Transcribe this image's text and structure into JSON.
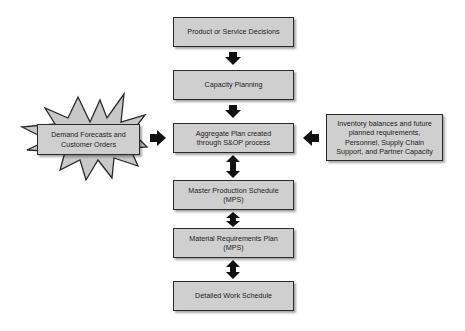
{
  "diagram": {
    "colors": {
      "box_fill": "#cfcfcf",
      "box_border": "#2a2a2a",
      "arrow": "#111111",
      "text": "#222222"
    },
    "main_flow": [
      {
        "id": "product",
        "label": "Product or Service Decisions"
      },
      {
        "id": "capacity",
        "label": "Capacity Planning"
      },
      {
        "id": "aggregate",
        "label": "Aggregate Plan created through S&OP process"
      },
      {
        "id": "mps",
        "label": "Master Production Schedule (MPS)"
      },
      {
        "id": "mrp",
        "label": "Material Requirements Plan (MPS)"
      },
      {
        "id": "detailed",
        "label": "Detailed Work Schedule"
      }
    ],
    "left_input": {
      "label": "Demand Forecasts and Customer Orders",
      "shape": "starburst"
    },
    "right_input": {
      "label": "Inventory balances and future planned requirements, Personnel, Supply Chain Support, and Partner Capacity"
    },
    "connectors": [
      {
        "from": "product",
        "to": "capacity",
        "type": "down-arrow"
      },
      {
        "from": "capacity",
        "to": "aggregate",
        "type": "down-arrow"
      },
      {
        "from": "left_input",
        "to": "aggregate",
        "type": "right-arrow"
      },
      {
        "from": "right_input",
        "to": "aggregate",
        "type": "left-arrow"
      },
      {
        "from": "aggregate",
        "to": "mps",
        "type": "double-arrow"
      },
      {
        "from": "mps",
        "to": "mrp",
        "type": "double-arrow"
      },
      {
        "from": "mrp",
        "to": "detailed",
        "type": "double-arrow"
      }
    ]
  }
}
